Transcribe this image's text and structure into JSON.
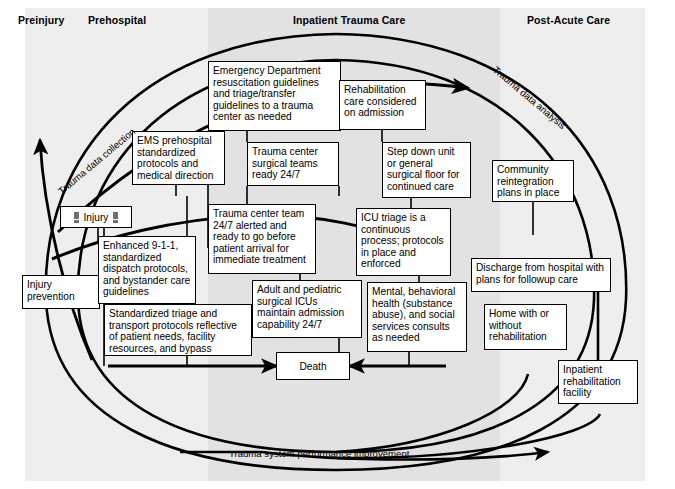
{
  "figure": {
    "columns": [
      {
        "id": "preinjury",
        "label": "Preinjury"
      },
      {
        "id": "prehospital",
        "label": "Prehospital"
      },
      {
        "id": "inpatient",
        "label": "Inpatient Trauma Care"
      },
      {
        "id": "postacute",
        "label": "Post-Acute Care"
      }
    ],
    "cycle_labels": {
      "data_collection": "Trauma data collection",
      "data_analysis": "Trauma data analysis",
      "performance_improvement": "Trauma system performance improvement"
    },
    "nodes": [
      {
        "id": "injury",
        "label": "Injury"
      },
      {
        "id": "injury-prevention",
        "label": "Injury prevention"
      },
      {
        "id": "emergency-department",
        "label": "Emergency Department resuscitation guidelines and triage/transfer guidelines to a trauma center as needed"
      },
      {
        "id": "ems-prehospital",
        "label": "EMS prehospital standardized protocols and medical direction"
      },
      {
        "id": "trauma-surgical-teams",
        "label": "Trauma center surgical teams ready 24/7"
      },
      {
        "id": "rehabilitation-care",
        "label": "Rehabilitation care considered on admission"
      },
      {
        "id": "step-down-unit",
        "label": "Step down unit or general surgical floor for continued care"
      },
      {
        "id": "community-reintegration",
        "label": "Community reintegration plans in place"
      },
      {
        "id": "enhanced-911",
        "label": "Enhanced 9-1-1, standardized dispatch protocols, and bystander care guidelines"
      },
      {
        "id": "trauma-center-team",
        "label": "Trauma center team 24/7 alerted and ready to go before patient arrival for immediate treatment"
      },
      {
        "id": "icu-triage",
        "label": "ICU triage is a continuous process; protocols in place and enforced"
      },
      {
        "id": "standardized-triage",
        "label": "Standardized triage and transport protocols reflective of patient needs, facility resources, and bypass"
      },
      {
        "id": "adult-pediatric-icu",
        "label": "Adult and pediatric surgical ICUs maintain admission capability 24/7"
      },
      {
        "id": "mental-behavioral",
        "label": "Mental, behavioral health (substance abuse), and social services consults as needed"
      },
      {
        "id": "discharge",
        "label": "Discharge from hospital with plans for followup care"
      },
      {
        "id": "home-with-without-rehab",
        "label": "Home with or without rehabilitation"
      },
      {
        "id": "inpatient-rehab",
        "label": "Inpatient rehabilitation facility"
      },
      {
        "id": "death",
        "label": "Death"
      }
    ],
    "colors": {
      "line": "#000000",
      "box_fill": "#ffffff",
      "band_light": "#eeeeee",
      "band_dark": "#e2e2e2",
      "warning_glyph": "#6f6f6f"
    }
  }
}
